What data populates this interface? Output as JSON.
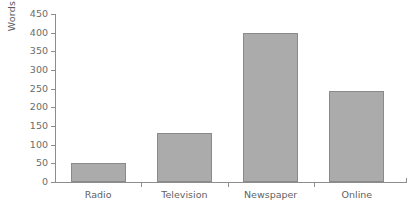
{
  "chart_data": {
    "type": "bar",
    "title": "",
    "subtitle": "",
    "xlabel": "",
    "ylabel": "Words",
    "categories": [
      "Radio",
      "Television",
      "Newspaper",
      "Online"
    ],
    "values": [
      50,
      130,
      400,
      245
    ],
    "ylim": [
      0,
      450
    ],
    "yticks": [
      0,
      50,
      100,
      150,
      200,
      250,
      300,
      350,
      400,
      450
    ],
    "ytick_labels": [
      "0",
      "50",
      "100",
      "150",
      "200",
      "250",
      "300",
      "350",
      "400",
      "450"
    ],
    "grid": false,
    "legend": false,
    "legend_position": "none",
    "series": [
      {
        "name": "Words",
        "values": [
          50,
          130,
          400,
          245
        ]
      }
    ],
    "colors": {
      "bar_fill": "#ababab",
      "bar_border": "#8a8a8a",
      "axis": "#8d8d8d",
      "text": "#5f5f5f",
      "background": "#ffffff"
    }
  }
}
